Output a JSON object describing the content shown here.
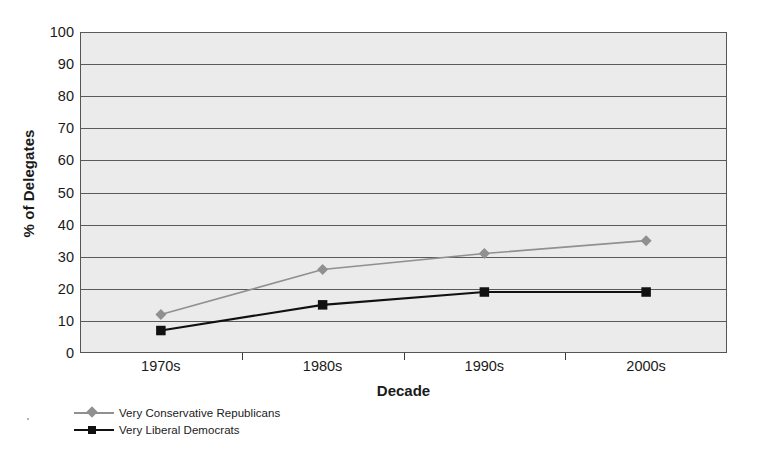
{
  "chart_data": {
    "type": "line",
    "title": "",
    "xlabel": "Decade",
    "ylabel": "% of Delegates",
    "categories": [
      "1970s",
      "1980s",
      "1990s",
      "2000s"
    ],
    "ylim": [
      0,
      100
    ],
    "ytick_step": 10,
    "yticks": [
      "100",
      "90",
      "80",
      "70",
      "60",
      "50",
      "40",
      "30",
      "20",
      "10",
      "0"
    ],
    "grid": true,
    "legend_position": "below-axis-left",
    "plot_background": "#ebebeb",
    "series": [
      {
        "name": "Very Conservative Republicans",
        "values": [
          12,
          26,
          31,
          35
        ],
        "color": "#909090",
        "marker": "diamond"
      },
      {
        "name": "Very Liberal Democrats",
        "values": [
          7,
          15,
          19,
          19
        ],
        "color": "#111111",
        "marker": "square"
      }
    ]
  },
  "legend": {
    "items": [
      {
        "label": "Very Conservative Republicans",
        "color": "#909090",
        "marker": "diamond-marker-icon"
      },
      {
        "label": "Very Liberal Democrats",
        "color": "#111111",
        "marker": "square-marker-icon"
      }
    ]
  }
}
